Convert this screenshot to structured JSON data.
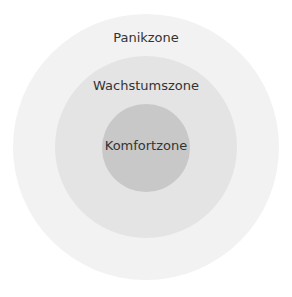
{
  "diagram": {
    "type": "concentric-circles",
    "zones": [
      {
        "label": "Panikzone",
        "color": "#f2f2f2"
      },
      {
        "label": "Wachstumszone",
        "color": "#e4e4e4"
      },
      {
        "label": "Komfortzone",
        "color": "#c8c8c8"
      }
    ],
    "text_color": "#333333"
  }
}
